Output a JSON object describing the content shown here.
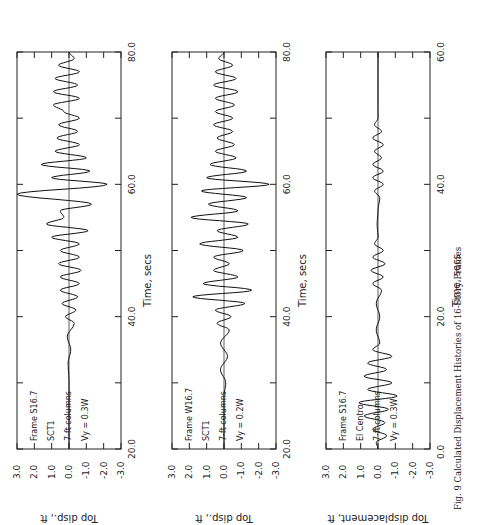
{
  "caption": "Fig. 9  Calculated Displacement Histories of 16-Story Frames",
  "chart_data": [
    {
      "type": "line",
      "title": "",
      "annotations": [
        "Frame S16.7",
        "SCT1",
        "7-ft columns",
        "Vy = 0.3W"
      ],
      "xlabel": "Time, secs",
      "ylabel": "Top disp., ft",
      "xlim": [
        20.0,
        80.0
      ],
      "ylim": [
        -3.0,
        3.0
      ],
      "xticks": [
        "20.0",
        "40.0",
        "60.0",
        "80.0"
      ],
      "yticks": [
        "3.0",
        "2.0",
        "1.0",
        "0.0",
        "-1.0",
        "-2.0",
        "-3.0"
      ],
      "grid": false,
      "series": [
        {
          "name": "Frame S16.7 SCT1",
          "peaks": [
            [
              20,
              0
            ],
            [
              30,
              0
            ],
            [
              33,
              0.05
            ],
            [
              35,
              -0.1
            ],
            [
              37,
              0.1
            ],
            [
              39,
              -0.3
            ],
            [
              40,
              0.2
            ],
            [
              41,
              -0.4
            ],
            [
              42,
              0.4
            ],
            [
              43,
              -0.5
            ],
            [
              44,
              0.5
            ],
            [
              45,
              -0.6
            ],
            [
              46,
              0.5
            ],
            [
              47,
              -0.7
            ],
            [
              48,
              0.6
            ],
            [
              49,
              -0.6
            ],
            [
              50,
              0.5
            ],
            [
              51,
              -0.6
            ],
            [
              52,
              1.0
            ],
            [
              53,
              -1.1
            ],
            [
              54,
              1.3
            ],
            [
              55,
              0.3
            ],
            [
              56,
              0.5
            ],
            [
              57,
              -1.3
            ],
            [
              58.5,
              3.0
            ],
            [
              60,
              -2.2
            ],
            [
              61,
              1.0
            ],
            [
              62,
              -1.2
            ],
            [
              63,
              1.6
            ],
            [
              64,
              -1.0
            ],
            [
              65,
              0.8
            ],
            [
              66,
              -0.6
            ],
            [
              67,
              0.7
            ],
            [
              68,
              -0.5
            ],
            [
              69,
              0.6
            ],
            [
              70,
              -0.6
            ],
            [
              71,
              0.3
            ],
            [
              72,
              0.9
            ],
            [
              73,
              -0.6
            ],
            [
              74,
              0.9
            ],
            [
              75,
              -0.5
            ],
            [
              76,
              0.8
            ],
            [
              77,
              -0.6
            ],
            [
              78,
              0.6
            ],
            [
              79,
              -0.3
            ],
            [
              80,
              0.0
            ]
          ]
        }
      ]
    },
    {
      "type": "line",
      "title": "",
      "annotations": [
        "Frame W16.7",
        "SCT1",
        "7-ft columns",
        "Vy = 0.2W"
      ],
      "xlabel": "Time, secs",
      "ylabel": "Top disp., ft",
      "xlim": [
        20.0,
        80.0
      ],
      "ylim": [
        -3.0,
        3.0
      ],
      "xticks": [
        "20.0",
        "40.0",
        "60.0",
        "80.0"
      ],
      "yticks": [
        "3.0",
        "2.0",
        "1.0",
        "0.0",
        "-1.0",
        "-2.0",
        "-3.0"
      ],
      "grid": false,
      "series": [
        {
          "name": "Frame W16.7 SCT1",
          "peaks": [
            [
              20,
              0
            ],
            [
              28,
              0
            ],
            [
              30,
              -0.1
            ],
            [
              32,
              0.2
            ],
            [
              34,
              -0.2
            ],
            [
              36,
              0.2
            ],
            [
              38,
              -0.3
            ],
            [
              39,
              0.4
            ],
            [
              40,
              -0.4
            ],
            [
              41,
              0.5
            ],
            [
              42,
              -1.2
            ],
            [
              43,
              1.8
            ],
            [
              44,
              -1.6
            ],
            [
              45,
              1.2
            ],
            [
              46,
              -0.8
            ],
            [
              47,
              0.6
            ],
            [
              48,
              -0.3
            ],
            [
              49,
              0.6
            ],
            [
              50,
              -1.1
            ],
            [
              51,
              1.4
            ],
            [
              52,
              -0.8
            ],
            [
              53,
              0.4
            ],
            [
              54,
              -1.4
            ],
            [
              55,
              1.9
            ],
            [
              56,
              -0.8
            ],
            [
              57,
              0.9
            ],
            [
              58,
              -1.3
            ],
            [
              59,
              1.3
            ],
            [
              60,
              -2.6
            ],
            [
              61,
              1.0
            ],
            [
              62,
              -1.3
            ],
            [
              63,
              0.8
            ],
            [
              64,
              -0.7
            ],
            [
              65,
              0.5
            ],
            [
              66,
              -0.6
            ],
            [
              67,
              0.4
            ],
            [
              68,
              -0.5
            ],
            [
              69,
              0.6
            ],
            [
              70,
              -0.5
            ],
            [
              71,
              0.5
            ],
            [
              72,
              -0.6
            ],
            [
              73,
              0.5
            ],
            [
              74,
              -0.8
            ],
            [
              75,
              0.6
            ],
            [
              76,
              -0.7
            ],
            [
              77,
              0.5
            ],
            [
              78,
              -0.5
            ],
            [
              79,
              0.3
            ],
            [
              80,
              0.0
            ]
          ]
        }
      ]
    },
    {
      "type": "line",
      "title": "",
      "annotations": [
        "Frame S16.7",
        "El Centro",
        "7-ft columns",
        "Vy = 0.3W"
      ],
      "xlabel": "Time, secs",
      "ylabel": "Top displacement, ft",
      "xlim": [
        0.0,
        60.0
      ],
      "ylim": [
        -3.0,
        3.0
      ],
      "xticks": [
        "0.0",
        "20.0",
        "40.0",
        "60.0"
      ],
      "yticks": [
        "3.0",
        "2.0",
        "1.0",
        "0.0",
        "-1.0",
        "-2.0",
        "-3.0"
      ],
      "grid": false,
      "series": [
        {
          "name": "Frame S16.7 El Centro",
          "peaks": [
            [
              0,
              0
            ],
            [
              1,
              0.1
            ],
            [
              2,
              -0.5
            ],
            [
              3,
              0.3
            ],
            [
              4,
              -0.4
            ],
            [
              5,
              0.8
            ],
            [
              6,
              -0.6
            ],
            [
              7,
              1.1
            ],
            [
              8,
              -1.1
            ],
            [
              9,
              0.6
            ],
            [
              10,
              -0.8
            ],
            [
              11,
              0.8
            ],
            [
              12,
              -0.5
            ],
            [
              13,
              0.6
            ],
            [
              14,
              -0.8
            ],
            [
              15,
              0.3
            ],
            [
              16,
              -0.1
            ],
            [
              18,
              0.1
            ],
            [
              20,
              -0.1
            ],
            [
              22,
              0.1
            ],
            [
              24,
              -0.2
            ],
            [
              25,
              0.3
            ],
            [
              26,
              -0.3
            ],
            [
              27,
              0.4
            ],
            [
              28,
              -0.4
            ],
            [
              29,
              0.3
            ],
            [
              30,
              -0.3
            ],
            [
              31,
              0.2
            ],
            [
              32,
              0.0
            ],
            [
              34,
              0.05
            ],
            [
              36,
              0.0
            ],
            [
              38,
              -0.1
            ],
            [
              39,
              0.2
            ],
            [
              40,
              -0.3
            ],
            [
              41,
              0.3
            ],
            [
              42,
              -0.3
            ],
            [
              43,
              0.3
            ],
            [
              44,
              -0.2
            ],
            [
              45,
              0.2
            ],
            [
              46,
              -0.3
            ],
            [
              47,
              0.3
            ],
            [
              48,
              -0.2
            ],
            [
              49,
              0.2
            ],
            [
              50,
              0.0
            ],
            [
              52,
              0.0
            ],
            [
              60,
              0.0
            ]
          ]
        }
      ]
    }
  ]
}
